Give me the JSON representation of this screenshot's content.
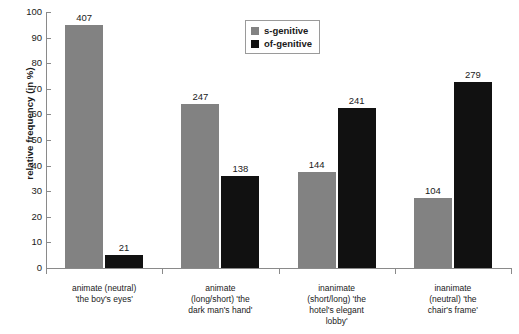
{
  "chart_data": {
    "type": "bar",
    "title": "",
    "xlabel": "",
    "ylabel": "relative frequency (in %)",
    "ylim": [
      0,
      100
    ],
    "ytick_values": [
      0,
      10,
      20,
      30,
      40,
      50,
      60,
      70,
      80,
      90,
      100
    ],
    "grid": false,
    "legend_position": "top-center",
    "categories": [
      "animate (neutral) 'the boy's eyes'",
      "animate (long/short) 'the dark man's hand'",
      "inanimate (short/long) 'the hotel's elegant lobby'",
      "inanimate (neutral) 'the chair's frame'"
    ],
    "category_lines": [
      [
        "animate (neutral)",
        "'the boy's eyes'"
      ],
      [
        "animate",
        "(long/short) 'the",
        "dark man's hand'"
      ],
      [
        "inanimate",
        "(short/long) 'the",
        "hotel's elegant",
        "lobby'"
      ],
      [
        "inanimate",
        "(neutral) 'the",
        "chair's frame'"
      ]
    ],
    "series": [
      {
        "name": "s-genitive",
        "color": "#828282",
        "values": [
          95.1,
          64.2,
          37.4,
          27.2
        ],
        "counts": [
          407,
          247,
          144,
          104
        ]
      },
      {
        "name": "of-genitive",
        "color": "#111111",
        "values": [
          4.9,
          35.8,
          62.6,
          72.8
        ],
        "counts": [
          21,
          138,
          241,
          279
        ]
      }
    ]
  },
  "legend": {
    "items": [
      {
        "label": "s-genitive"
      },
      {
        "label": "of-genitive"
      }
    ]
  }
}
